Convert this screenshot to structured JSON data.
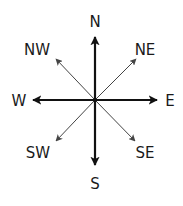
{
  "diagram": {
    "colors": {
      "background": "#ffffff",
      "cardinal_arrow": "#111111",
      "intercardinal_arrow": "#444444",
      "label": "#1a1a1a"
    },
    "center": {
      "x": 95,
      "y": 100
    },
    "cardinal": [
      {
        "id": "n",
        "label": "N",
        "tip": {
          "x": 95,
          "y": 37
        },
        "label_pos": {
          "x": 95,
          "y": 27
        }
      },
      {
        "id": "e",
        "label": "E",
        "tip": {
          "x": 157,
          "y": 100
        },
        "label_pos": {
          "x": 170,
          "y": 106
        }
      },
      {
        "id": "s",
        "label": "S",
        "tip": {
          "x": 95,
          "y": 165
        },
        "label_pos": {
          "x": 95,
          "y": 189
        }
      },
      {
        "id": "w",
        "label": "W",
        "tip": {
          "x": 33,
          "y": 100
        },
        "label_pos": {
          "x": 19,
          "y": 106
        }
      }
    ],
    "intercardinal": [
      {
        "id": "ne",
        "label": "NE",
        "tip": {
          "x": 136,
          "y": 59
        },
        "label_pos": {
          "x": 145,
          "y": 55
        }
      },
      {
        "id": "se",
        "label": "SE",
        "tip": {
          "x": 135,
          "y": 141
        },
        "label_pos": {
          "x": 145,
          "y": 158
        }
      },
      {
        "id": "sw",
        "label": "SW",
        "tip": {
          "x": 56,
          "y": 141
        },
        "label_pos": {
          "x": 38,
          "y": 158
        }
      },
      {
        "id": "nw",
        "label": "NW",
        "tip": {
          "x": 56,
          "y": 59
        },
        "label_pos": {
          "x": 37,
          "y": 55
        }
      }
    ]
  }
}
